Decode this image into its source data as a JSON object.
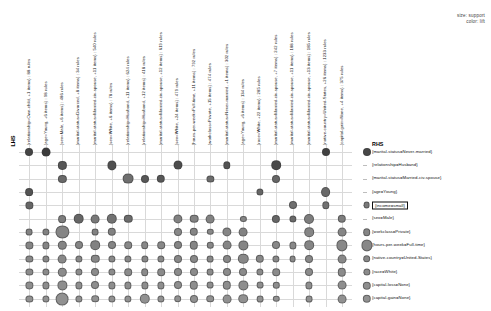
{
  "plot": {
    "type": "grouped-matrix-bubble",
    "lhs_axis_title": "LHS",
    "rhs_axis_title": "RHS",
    "legend": {
      "size_label": "size: support",
      "color_label": "color: lift"
    }
  },
  "chart_data": {
    "type": "scatter",
    "title": "",
    "xlabel": "LHS",
    "ylabel": "RHS",
    "legend_position": "top-right",
    "size_encodes": "support",
    "color_encodes": "lift",
    "grid": true,
    "categories_x": [
      "{relationship=Own-child, +1 items} : 88 rules",
      "{age=Young, +6 items} : 98 rules",
      "{sex=Male, +6 items} : 486 rules",
      "{marital-status=Divorced, +8 items} : 34 rules",
      "{marital-status=Married-civ-spouse, +11 items} : 540 rules",
      "{sex=White, +6 items} : 78 rules",
      "{relationship=Husband, +11 items} : 624 rules",
      "{relationship=Husband, +12 items} : 418 rules",
      "{marital-status=Married-civ-spouse, +12 items} : 619 rules",
      "{sex=White, +24 items} : 479 rules",
      "{hours-per-week=Full-time, +11 items} : 792 rules",
      "{workclass=Private, +15 items} : 474 rules",
      "{marital-status=Never-married, +1 items} : 302 rules",
      "{age=Young, +6 items} : 134 rules",
      "{race=White, +22 items} : 285 rules",
      "{marital-status=Married-civ-spouse, +7 items} : 242 rules",
      "{marital-status=Married-civ-spouse, +11 items} : 188 rules",
      "{marital-status=Married-civ-spouse, +13 items} : 185 rules",
      "{native-country=United-States, +26 items} : 1233 rules",
      "{capital-gain=None, +4 items} : 375 rules"
    ],
    "categories_y": [
      "{marital-status=Never-married}",
      "{relationship=Husband}",
      "{marital-status=Married-civ-spouse}",
      "{age=Young}",
      "{income=small}",
      "{sex=Male}",
      "{workclass=Private}",
      "{hours-per-week=Full-time}",
      "{native-country=United-States}",
      "{race=White}",
      "{capital-loss=None}",
      "{capital-gain=None}"
    ],
    "highlighted_y": "{income=small}",
    "points": [
      {
        "x": 0,
        "y": 0,
        "size": 3.0,
        "shade": 0.18
      },
      {
        "x": 1,
        "y": 0,
        "size": 3.4,
        "shade": 0.12
      },
      {
        "x": 18,
        "y": 0,
        "size": 3.0,
        "shade": 0.16
      },
      {
        "x": 2,
        "y": 1,
        "size": 3.1,
        "shade": 0.3
      },
      {
        "x": 5,
        "y": 1,
        "size": 3.6,
        "shade": 0.26
      },
      {
        "x": 9,
        "y": 1,
        "size": 3.5,
        "shade": 0.24
      },
      {
        "x": 12,
        "y": 1,
        "size": 2.7,
        "shade": 0.28
      },
      {
        "x": 15,
        "y": 1,
        "size": 3.8,
        "shade": 0.22
      },
      {
        "x": 2,
        "y": 2,
        "size": 3.1,
        "shade": 0.42
      },
      {
        "x": 6,
        "y": 2,
        "size": 4.4,
        "shade": 0.46
      },
      {
        "x": 7,
        "y": 2,
        "size": 3.0,
        "shade": 0.3
      },
      {
        "x": 8,
        "y": 2,
        "size": 3.2,
        "shade": 0.3
      },
      {
        "x": 11,
        "y": 2,
        "size": 2.6,
        "shade": 0.44
      },
      {
        "x": 15,
        "y": 2,
        "size": 3.0,
        "shade": 0.4
      },
      {
        "x": 0,
        "y": 3,
        "size": 2.9,
        "shade": 0.28
      },
      {
        "x": 14,
        "y": 3,
        "size": 2.6,
        "shade": 0.4
      },
      {
        "x": 18,
        "y": 3,
        "size": 3.9,
        "shade": 0.42
      },
      {
        "x": 0,
        "y": 4,
        "size": 2.6,
        "shade": 0.4
      },
      {
        "x": 16,
        "y": 4,
        "size": 3.0,
        "shade": 0.46
      },
      {
        "x": 18,
        "y": 4,
        "size": 2.7,
        "shade": 0.48
      },
      {
        "x": 2,
        "y": 5,
        "size": 2.9,
        "shade": 0.55
      },
      {
        "x": 3,
        "y": 5,
        "size": 4.3,
        "shade": 0.4
      },
      {
        "x": 4,
        "y": 5,
        "size": 3.4,
        "shade": 0.52
      },
      {
        "x": 5,
        "y": 5,
        "size": 4.2,
        "shade": 0.48
      },
      {
        "x": 6,
        "y": 5,
        "size": 3.2,
        "shade": 0.44
      },
      {
        "x": 9,
        "y": 5,
        "size": 3.6,
        "shade": 0.58
      },
      {
        "x": 10,
        "y": 5,
        "size": 3.3,
        "shade": 0.58
      },
      {
        "x": 11,
        "y": 5,
        "size": 3.4,
        "shade": 0.58
      },
      {
        "x": 13,
        "y": 5,
        "size": 2.1,
        "shade": 0.6
      },
      {
        "x": 15,
        "y": 5,
        "size": 3.1,
        "shade": 0.4
      },
      {
        "x": 16,
        "y": 5,
        "size": 2.6,
        "shade": 0.42
      },
      {
        "x": 17,
        "y": 5,
        "size": 4.0,
        "shade": 0.55
      },
      {
        "x": 19,
        "y": 5,
        "size": 3.2,
        "shade": 0.55
      },
      {
        "x": 0,
        "y": 6,
        "size": 2.4,
        "shade": 0.58
      },
      {
        "x": 1,
        "y": 6,
        "size": 2.6,
        "shade": 0.58
      },
      {
        "x": 2,
        "y": 6,
        "size": 5.6,
        "shade": 0.6
      },
      {
        "x": 4,
        "y": 6,
        "size": 2.4,
        "shade": 0.58
      },
      {
        "x": 5,
        "y": 6,
        "size": 3.2,
        "shade": 0.58
      },
      {
        "x": 9,
        "y": 6,
        "size": 3.0,
        "shade": 0.62
      },
      {
        "x": 10,
        "y": 6,
        "size": 3.2,
        "shade": 0.6
      },
      {
        "x": 11,
        "y": 6,
        "size": 2.2,
        "shade": 0.62
      },
      {
        "x": 12,
        "y": 6,
        "size": 3.6,
        "shade": 0.6
      },
      {
        "x": 13,
        "y": 6,
        "size": 3.4,
        "shade": 0.58
      },
      {
        "x": 17,
        "y": 6,
        "size": 3.8,
        "shade": 0.6
      },
      {
        "x": 19,
        "y": 6,
        "size": 3.4,
        "shade": 0.6
      },
      {
        "x": 0,
        "y": 7,
        "size": 2.6,
        "shade": 0.6
      },
      {
        "x": 1,
        "y": 7,
        "size": 2.6,
        "shade": 0.6
      },
      {
        "x": 2,
        "y": 7,
        "size": 3.2,
        "shade": 0.6
      },
      {
        "x": 3,
        "y": 7,
        "size": 3.0,
        "shade": 0.6
      },
      {
        "x": 4,
        "y": 7,
        "size": 3.8,
        "shade": 0.58
      },
      {
        "x": 5,
        "y": 7,
        "size": 3.0,
        "shade": 0.6
      },
      {
        "x": 6,
        "y": 7,
        "size": 2.8,
        "shade": 0.62
      },
      {
        "x": 7,
        "y": 7,
        "size": 2.8,
        "shade": 0.62
      },
      {
        "x": 8,
        "y": 7,
        "size": 2.8,
        "shade": 0.62
      },
      {
        "x": 9,
        "y": 7,
        "size": 3.0,
        "shade": 0.6
      },
      {
        "x": 10,
        "y": 7,
        "size": 3.2,
        "shade": 0.6
      },
      {
        "x": 11,
        "y": 7,
        "size": 2.2,
        "shade": 0.62
      },
      {
        "x": 12,
        "y": 7,
        "size": 3.4,
        "shade": 0.6
      },
      {
        "x": 13,
        "y": 7,
        "size": 3.6,
        "shade": 0.6
      },
      {
        "x": 15,
        "y": 7,
        "size": 3.0,
        "shade": 0.62
      },
      {
        "x": 16,
        "y": 7,
        "size": 2.6,
        "shade": 0.62
      },
      {
        "x": 17,
        "y": 7,
        "size": 3.8,
        "shade": 0.6
      },
      {
        "x": 19,
        "y": 7,
        "size": 4.6,
        "shade": 0.62
      },
      {
        "x": 0,
        "y": 8,
        "size": 2.6,
        "shade": 0.62
      },
      {
        "x": 1,
        "y": 8,
        "size": 2.6,
        "shade": 0.62
      },
      {
        "x": 2,
        "y": 8,
        "size": 3.4,
        "shade": 0.62
      },
      {
        "x": 3,
        "y": 8,
        "size": 2.6,
        "shade": 0.62
      },
      {
        "x": 4,
        "y": 8,
        "size": 3.2,
        "shade": 0.62
      },
      {
        "x": 5,
        "y": 8,
        "size": 2.6,
        "shade": 0.62
      },
      {
        "x": 6,
        "y": 8,
        "size": 2.6,
        "shade": 0.62
      },
      {
        "x": 7,
        "y": 8,
        "size": 2.6,
        "shade": 0.62
      },
      {
        "x": 8,
        "y": 8,
        "size": 2.6,
        "shade": 0.62
      },
      {
        "x": 9,
        "y": 8,
        "size": 3.0,
        "shade": 0.62
      },
      {
        "x": 10,
        "y": 8,
        "size": 3.0,
        "shade": 0.62
      },
      {
        "x": 11,
        "y": 8,
        "size": 2.4,
        "shade": 0.62
      },
      {
        "x": 12,
        "y": 8,
        "size": 3.0,
        "shade": 0.62
      },
      {
        "x": 13,
        "y": 8,
        "size": 4.2,
        "shade": 0.62
      },
      {
        "x": 14,
        "y": 8,
        "size": 3.2,
        "shade": 0.62
      },
      {
        "x": 15,
        "y": 8,
        "size": 2.6,
        "shade": 0.62
      },
      {
        "x": 16,
        "y": 8,
        "size": 2.4,
        "shade": 0.62
      },
      {
        "x": 17,
        "y": 8,
        "size": 3.0,
        "shade": 0.62
      },
      {
        "x": 19,
        "y": 8,
        "size": 3.4,
        "shade": 0.62
      },
      {
        "x": 0,
        "y": 9,
        "size": 2.6,
        "shade": 0.64
      },
      {
        "x": 1,
        "y": 9,
        "size": 2.6,
        "shade": 0.64
      },
      {
        "x": 2,
        "y": 9,
        "size": 3.2,
        "shade": 0.64
      },
      {
        "x": 3,
        "y": 9,
        "size": 2.6,
        "shade": 0.64
      },
      {
        "x": 4,
        "y": 9,
        "size": 3.0,
        "shade": 0.64
      },
      {
        "x": 5,
        "y": 9,
        "size": 2.6,
        "shade": 0.64
      },
      {
        "x": 6,
        "y": 9,
        "size": 2.8,
        "shade": 0.64
      },
      {
        "x": 7,
        "y": 9,
        "size": 2.8,
        "shade": 0.64
      },
      {
        "x": 8,
        "y": 9,
        "size": 2.8,
        "shade": 0.64
      },
      {
        "x": 9,
        "y": 9,
        "size": 3.0,
        "shade": 0.64
      },
      {
        "x": 10,
        "y": 9,
        "size": 3.0,
        "shade": 0.64
      },
      {
        "x": 11,
        "y": 9,
        "size": 2.4,
        "shade": 0.64
      },
      {
        "x": 12,
        "y": 9,
        "size": 3.0,
        "shade": 0.64
      },
      {
        "x": 13,
        "y": 9,
        "size": 3.0,
        "shade": 0.64
      },
      {
        "x": 14,
        "y": 9,
        "size": 2.6,
        "shade": 0.64
      },
      {
        "x": 15,
        "y": 9,
        "size": 2.8,
        "shade": 0.64
      },
      {
        "x": 17,
        "y": 9,
        "size": 3.0,
        "shade": 0.64
      },
      {
        "x": 19,
        "y": 9,
        "size": 3.2,
        "shade": 0.64
      },
      {
        "x": 0,
        "y": 10,
        "size": 2.6,
        "shade": 0.66
      },
      {
        "x": 1,
        "y": 10,
        "size": 2.6,
        "shade": 0.66
      },
      {
        "x": 2,
        "y": 10,
        "size": 3.6,
        "shade": 0.66
      },
      {
        "x": 3,
        "y": 10,
        "size": 2.6,
        "shade": 0.66
      },
      {
        "x": 4,
        "y": 10,
        "size": 3.0,
        "shade": 0.66
      },
      {
        "x": 5,
        "y": 10,
        "size": 2.6,
        "shade": 0.66
      },
      {
        "x": 6,
        "y": 10,
        "size": 2.6,
        "shade": 0.66
      },
      {
        "x": 7,
        "y": 10,
        "size": 2.6,
        "shade": 0.66
      },
      {
        "x": 8,
        "y": 10,
        "size": 2.6,
        "shade": 0.66
      },
      {
        "x": 9,
        "y": 10,
        "size": 3.0,
        "shade": 0.66
      },
      {
        "x": 10,
        "y": 10,
        "size": 3.2,
        "shade": 0.66
      },
      {
        "x": 11,
        "y": 10,
        "size": 2.4,
        "shade": 0.66
      },
      {
        "x": 12,
        "y": 10,
        "size": 3.2,
        "shade": 0.66
      },
      {
        "x": 13,
        "y": 10,
        "size": 3.6,
        "shade": 0.66
      },
      {
        "x": 14,
        "y": 10,
        "size": 2.4,
        "shade": 0.66
      },
      {
        "x": 15,
        "y": 10,
        "size": 2.2,
        "shade": 0.66
      },
      {
        "x": 17,
        "y": 10,
        "size": 2.6,
        "shade": 0.66
      },
      {
        "x": 19,
        "y": 10,
        "size": 3.4,
        "shade": 0.66
      },
      {
        "x": 0,
        "y": 11,
        "size": 2.6,
        "shade": 0.68
      },
      {
        "x": 1,
        "y": 11,
        "size": 2.6,
        "shade": 0.68
      },
      {
        "x": 2,
        "y": 11,
        "size": 5.4,
        "shade": 0.68
      },
      {
        "x": 3,
        "y": 11,
        "size": 2.6,
        "shade": 0.68
      },
      {
        "x": 4,
        "y": 11,
        "size": 2.8,
        "shade": 0.68
      },
      {
        "x": 5,
        "y": 11,
        "size": 2.6,
        "shade": 0.68
      },
      {
        "x": 6,
        "y": 11,
        "size": 2.6,
        "shade": 0.68
      },
      {
        "x": 7,
        "y": 11,
        "size": 4.2,
        "shade": 0.68
      },
      {
        "x": 8,
        "y": 11,
        "size": 2.6,
        "shade": 0.68
      },
      {
        "x": 9,
        "y": 11,
        "size": 2.8,
        "shade": 0.68
      },
      {
        "x": 10,
        "y": 11,
        "size": 3.0,
        "shade": 0.68
      },
      {
        "x": 11,
        "y": 11,
        "size": 2.8,
        "shade": 0.68
      },
      {
        "x": 12,
        "y": 11,
        "size": 3.4,
        "shade": 0.68
      },
      {
        "x": 13,
        "y": 11,
        "size": 3.8,
        "shade": 0.68
      },
      {
        "x": 14,
        "y": 11,
        "size": 2.4,
        "shade": 0.68
      },
      {
        "x": 15,
        "y": 11,
        "size": 2.2,
        "shade": 0.68
      },
      {
        "x": 17,
        "y": 11,
        "size": 2.4,
        "shade": 0.68
      },
      {
        "x": 19,
        "y": 11,
        "size": 3.4,
        "shade": 0.68
      }
    ],
    "rhs_key_points": [
      {
        "y": 0,
        "size": 3.0,
        "shade": 0.2
      },
      {
        "y": 4,
        "size": 2.4,
        "shade": 0.52
      },
      {
        "y": 6,
        "size": 2.8,
        "shade": 0.6
      },
      {
        "y": 7,
        "size": 4.6,
        "shade": 0.62
      },
      {
        "y": 8,
        "size": 2.8,
        "shade": 0.62
      },
      {
        "y": 9,
        "size": 2.6,
        "shade": 0.64
      },
      {
        "y": 10,
        "size": 3.2,
        "shade": 0.66
      },
      {
        "y": 11,
        "size": 3.2,
        "shade": 0.68
      }
    ]
  }
}
